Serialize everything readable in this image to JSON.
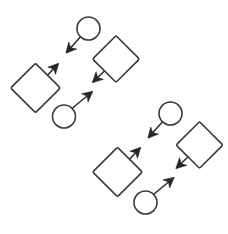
{
  "figure": {
    "background_color": "#ffffff",
    "width": 228,
    "height": 234,
    "stroke_color": "#3a3a3a",
    "arrow_color": "#262626",
    "shape_fill": "#ffffff",
    "motif_count": 2,
    "nodes_per_motif": 4,
    "arrows_per_motif": 4
  },
  "chart_data": {
    "type": "diagram",
    "xlabel": "",
    "ylabel": "",
    "xlim": [
      0,
      228
    ],
    "ylim": [
      0,
      234
    ],
    "grid": false,
    "legend": "none",
    "groups": [
      {
        "name": "motif-upper-left",
        "nodes": [
          {
            "id": "g1-circle-top",
            "shape": "circle",
            "cx": 88.5,
            "cy": 28.5,
            "r": 11.5
          },
          {
            "id": "g1-diamond-left",
            "shape": "diamond",
            "cx": 35.5,
            "cy": 88.0,
            "half": 17.5,
            "rotation": 45
          },
          {
            "id": "g1-diamond-right",
            "shape": "diamond",
            "cx": 116.0,
            "cy": 59.0,
            "half": 16.5,
            "rotation": 45
          },
          {
            "id": "g1-circle-bottom",
            "shape": "circle",
            "cx": 64.0,
            "cy": 116.5,
            "r": 11.5
          }
        ],
        "arrows": [
          {
            "id": "g1-arrow-a",
            "from": "g1-circle-top",
            "to": "down-left",
            "x1": 80.5,
            "y1": 36.8,
            "x2": 66.5,
            "y2": 52.5
          },
          {
            "id": "g1-arrow-b",
            "from": "g1-diamond-left",
            "to": "up-right",
            "x1": 44.0,
            "y1": 79.0,
            "x2": 58.0,
            "y2": 64.0
          },
          {
            "id": "g1-arrow-c",
            "from": "g1-diamond-right",
            "to": "down-left",
            "x1": 107.5,
            "y1": 68.0,
            "x2": 93.0,
            "y2": 82.0
          },
          {
            "id": "g1-arrow-d",
            "from": "g1-circle-bottom",
            "to": "up-right",
            "x1": 72.5,
            "y1": 108.0,
            "x2": 92.0,
            "y2": 92.0
          }
        ]
      },
      {
        "name": "motif-lower-right",
        "nodes": [
          {
            "id": "g2-circle-top",
            "shape": "circle",
            "cx": 170.5,
            "cy": 113.5,
            "r": 11.5
          },
          {
            "id": "g2-diamond-left",
            "shape": "diamond",
            "cx": 117.5,
            "cy": 172.0,
            "half": 17.5,
            "rotation": 45
          },
          {
            "id": "g2-diamond-right",
            "shape": "diamond",
            "cx": 199.5,
            "cy": 145.0,
            "half": 16.5,
            "rotation": 45
          },
          {
            "id": "g2-circle-bottom",
            "shape": "circle",
            "cx": 145.5,
            "cy": 202.5,
            "r": 11.5
          }
        ],
        "arrows": [
          {
            "id": "g2-arrow-a",
            "from": "g2-circle-top",
            "to": "down-left",
            "x1": 162.5,
            "y1": 121.8,
            "x2": 148.5,
            "y2": 137.5
          },
          {
            "id": "g2-arrow-b",
            "from": "g2-diamond-left",
            "to": "up-right",
            "x1": 126.0,
            "y1": 163.0,
            "x2": 140.0,
            "y2": 148.0
          },
          {
            "id": "g2-arrow-c",
            "from": "g2-diamond-right",
            "to": "down-left",
            "x1": 191.0,
            "y1": 154.0,
            "x2": 176.5,
            "y2": 168.0
          },
          {
            "id": "g2-arrow-d",
            "from": "g2-circle-bottom",
            "to": "up-right",
            "x1": 154.0,
            "y1": 194.0,
            "x2": 173.5,
            "y2": 178.0
          }
        ]
      }
    ]
  }
}
